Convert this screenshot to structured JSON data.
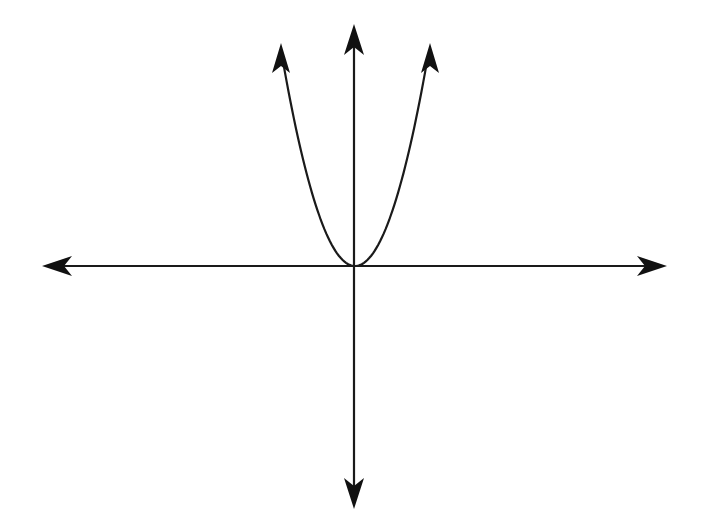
{
  "diagram": {
    "title": "Graph of an upward-opening parabola through the origin",
    "type": "coordinate-plane-sketch",
    "colors": {
      "background": "#ffffff",
      "ink": "#111111"
    },
    "origin_px": [
      355,
      266
    ],
    "x_axis": {
      "from_px": [
        42,
        266
      ],
      "to_px": [
        667,
        266
      ],
      "arrows": "both",
      "label": ""
    },
    "y_axis": {
      "from_px": [
        355,
        25
      ],
      "to_px": [
        355,
        508
      ],
      "arrows": "both",
      "label": ""
    },
    "curve": {
      "shape": "parabola",
      "equation_hint": "y = x^2",
      "opens": "up",
      "vertex_px": [
        355,
        266
      ],
      "left_end_px": [
        281,
        44
      ],
      "right_end_px": [
        430,
        44
      ],
      "arrows": "both-ends"
    },
    "labels": []
  }
}
